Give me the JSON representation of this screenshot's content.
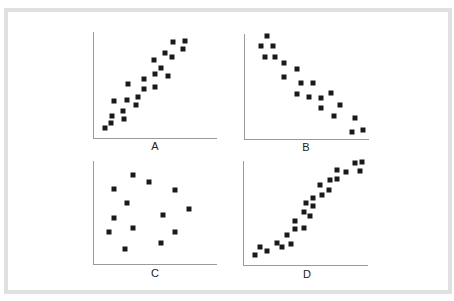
{
  "figure": {
    "border_color": "#e0e0e0",
    "marker_color": "#1a1a1a",
    "axis_color": "#9a9a9a"
  },
  "chart_data": [
    {
      "type": "scatter",
      "title": "A",
      "xlabel": "A",
      "ylabel": "",
      "description": "strong positive linear correlation",
      "xlim": [
        0,
        100
      ],
      "ylim": [
        0,
        100
      ],
      "grid": false,
      "points": [
        [
          5,
          5
        ],
        [
          11,
          10
        ],
        [
          12,
          17
        ],
        [
          13,
          32
        ],
        [
          21,
          22
        ],
        [
          22,
          14
        ],
        [
          25,
          33
        ],
        [
          26,
          50
        ],
        [
          33,
          28
        ],
        [
          35,
          36
        ],
        [
          40,
          44
        ],
        [
          40,
          55
        ],
        [
          49,
          74
        ],
        [
          50,
          60
        ],
        [
          50,
          46
        ],
        [
          55,
          66
        ],
        [
          59,
          81
        ],
        [
          62,
          58
        ],
        [
          65,
          77
        ],
        [
          66,
          92
        ],
        [
          75,
          85
        ],
        [
          77,
          93
        ]
      ]
    },
    {
      "type": "scatter",
      "title": "B",
      "xlabel": "B",
      "ylabel": "",
      "description": "strong negative linear correlation",
      "xlim": [
        0,
        100
      ],
      "ylim": [
        0,
        100
      ],
      "grid": false,
      "points": [
        [
          15,
          100
        ],
        [
          10,
          90
        ],
        [
          20,
          90
        ],
        [
          13,
          79
        ],
        [
          22,
          79
        ],
        [
          30,
          72
        ],
        [
          42,
          66
        ],
        [
          30,
          58
        ],
        [
          45,
          52
        ],
        [
          42,
          41
        ],
        [
          56,
          52
        ],
        [
          52,
          38
        ],
        [
          63,
          37
        ],
        [
          72,
          42
        ],
        [
          63,
          27
        ],
        [
          80,
          30
        ],
        [
          74,
          18
        ],
        [
          93,
          16
        ],
        [
          90,
          2
        ],
        [
          100,
          4
        ]
      ]
    },
    {
      "type": "scatter",
      "title": "C",
      "xlabel": "C",
      "ylabel": "",
      "description": "no correlation",
      "xlim": [
        0,
        100
      ],
      "ylim": [
        0,
        100
      ],
      "grid": false,
      "points": [
        [
          30,
          88
        ],
        [
          45,
          80
        ],
        [
          13,
          73
        ],
        [
          68,
          72
        ],
        [
          25,
          58
        ],
        [
          80,
          52
        ],
        [
          57,
          46
        ],
        [
          13,
          43
        ],
        [
          9,
          28
        ],
        [
          30,
          32
        ],
        [
          68,
          28
        ],
        [
          55,
          17
        ],
        [
          23,
          10
        ]
      ]
    },
    {
      "type": "scatter",
      "title": "D",
      "xlabel": "D",
      "ylabel": "",
      "description": "non-linear positive (S-shaped) correlation",
      "xlim": [
        0,
        100
      ],
      "ylim": [
        0,
        100
      ],
      "grid": false,
      "points": [
        [
          5,
          5
        ],
        [
          10,
          13
        ],
        [
          16,
          9
        ],
        [
          25,
          18
        ],
        [
          29,
          13
        ],
        [
          34,
          26
        ],
        [
          37,
          17
        ],
        [
          41,
          40
        ],
        [
          41,
          32
        ],
        [
          49,
          33
        ],
        [
          49,
          50
        ],
        [
          50,
          59
        ],
        [
          54,
          45
        ],
        [
          57,
          56
        ],
        [
          57,
          64
        ],
        [
          63,
          77
        ],
        [
          65,
          67
        ],
        [
          71,
          72
        ],
        [
          72,
          82
        ],
        [
          78,
          84
        ],
        [
          78,
          93
        ],
        [
          86,
          91
        ],
        [
          94,
          100
        ],
        [
          98,
          92
        ],
        [
          100,
          101
        ]
      ]
    }
  ]
}
